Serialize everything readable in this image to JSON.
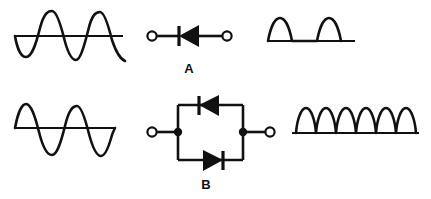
{
  "figure": {
    "background_color": "#ffffff",
    "ink_color": "#111111",
    "width": 431,
    "height": 199
  },
  "rows": [
    {
      "id": "row-a",
      "label": "A",
      "description": "Single diode half-wave rectifier",
      "input_waveform": {
        "kind": "sine",
        "cycles": 2.25,
        "starts_negative": true,
        "baseline_y": 36,
        "amplitude": 26
      },
      "circuit": {
        "kind": "single-diode",
        "diode_direction": "left",
        "terminals": 2
      },
      "output_waveform": {
        "kind": "half-wave-rectified",
        "humps": 2,
        "baseline_y": 41,
        "amplitude": 23
      }
    },
    {
      "id": "row-b",
      "label": "B",
      "description": "Antiparallel diode pair, full-wave output",
      "input_waveform": {
        "kind": "sine",
        "cycles": 2.25,
        "starts_negative": false,
        "baseline_y": 128,
        "amplitude": 26
      },
      "circuit": {
        "kind": "antiparallel-diode-pair",
        "top_diode_direction": "left",
        "bottom_diode_direction": "right",
        "terminals": 2,
        "junction_nodes": 2
      },
      "output_waveform": {
        "kind": "full-wave-rectified",
        "humps": 6,
        "baseline_y": 133,
        "amplitude": 25
      }
    }
  ],
  "labels": {
    "row_a": "A",
    "row_b": "B"
  }
}
